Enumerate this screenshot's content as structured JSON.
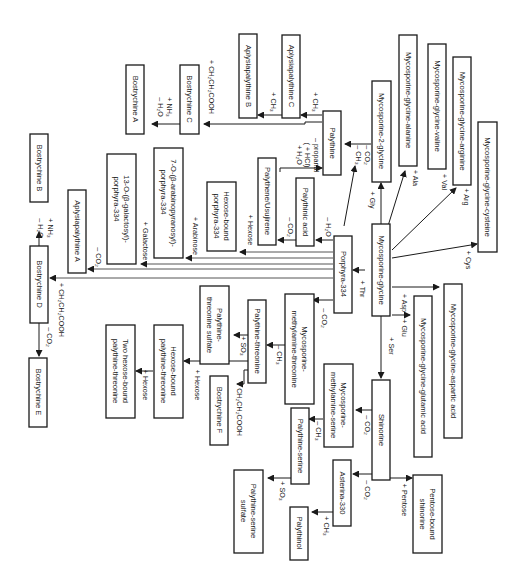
{
  "diagram": {
    "title": "",
    "orientation": "rotated-90-clockwise",
    "nodes": {
      "mg": "Mycosporine-glycine",
      "m2g": "Mycosporine-2-glycine",
      "mga": "Mycosporine-glycine-alanine",
      "mgv": "Mycosporine-glycine-valine",
      "mgr": "Mycosporine-glycine-arginine",
      "mgc": "Mycosporine-glycine-cysteine",
      "mgasp": "Mycosporine-glycine-aspartic acid",
      "mgglu": "Mycosporine-glycine-glutamic acid",
      "palythine": "Palythine",
      "aplyC": "Aplysiapalythine C",
      "aplyB": "Aplysiapalythine B",
      "bostC": "Bostrychine C",
      "bostA": "Bostrychine A",
      "palythene": "Palythene/Usujirene",
      "palythinic": "Palythinic acid",
      "p334": "Porphyra-334",
      "hexp334_1": "Hexose-bound",
      "hexp334_2": "porphyra-334",
      "arab_1": "7-O-(β-arabinopyranosyl)-",
      "arab_2": "porphyra-334",
      "gal_1": "13-O-(β-galactosyl)-",
      "gal_2": "porphyra-334",
      "aplyA": "Aplysiapalythine A",
      "bostB": "Bostrychine B",
      "bostD": "Bostrychine D",
      "bostE": "Bostrychine E",
      "mmt_1": "Mycosporine-",
      "mmt_2": "methylamine-threonine",
      "pthr": "Palythine-threonine",
      "pthrs_1": "Palythine-",
      "pthrs_2": "threonine sulfate",
      "bostF": "Bostrychine F",
      "hexpthr_1": "Hexose-bound",
      "hexpthr_2": "palythine-threonine",
      "twohex_1": "Two hexose-bound",
      "twohex_2": "palythine-threonine",
      "shinorine": "Shinorine",
      "mms_1": "Mycosporine-",
      "mms_2": "methylamine-serine",
      "pser": "Palythine-serine",
      "psers_1": "Palythine-serine",
      "psers_2": "sulfate",
      "ast": "Asterina-330",
      "palythinol": "Palythinol",
      "pent_1": "Pentose-bound",
      "pent_2": "shinorine"
    },
    "edge_labels": {
      "gly": "+ Gly",
      "ala": "+ Ala",
      "val": "+ Val",
      "arg": "+ Arg",
      "cys": "+ Cys",
      "asp": "+ Asp",
      "glu": "+ Glu",
      "ser": "+ Ser",
      "thr": "+ Thr",
      "m2g_co2": "– CO₂",
      "m2g_ch3": "– CH₃",
      "pal_ch3_a": "+ CH₃",
      "pal_ch3_b": "+ CH₃",
      "pal_ccooh": "+ CH₂CH₂COOH",
      "nh3_a": "+ NH₃",
      "h2o_a": "– H₂O",
      "propanal": "– propanal",
      "hcl": "( + HCl)",
      "h2o_add": "+ H₂O",
      "p334_h2o": "– H₂O",
      "palythinic_co2": "– CO₂",
      "hexose1": "+ Hexose",
      "arabinose": "+ Arabinose",
      "galactose": "+ Galactose",
      "p334_co2_a": "– CO₂",
      "nh3_b": "+ NH₃",
      "h2o_b": "– H₂O",
      "bostD_ccooh": "+ CH₂CH₂COOH",
      "bostD_co2": "– CO₂",
      "p334_co2_b": "– CO₂",
      "mmt_ch3": "– CH₃",
      "so3_a": "+ SO₃",
      "ccooh_f": "+ CH₂CH₂COOH",
      "hexose2": "+ Hexose",
      "hexose3": "+ Hexose",
      "shin_co2_a": "– CO₂",
      "mms_ch3": "– CH₃",
      "so3_b": "+ SO₃",
      "shin_co2_b": "– CO₂",
      "ast_ch3": "+ CH₃",
      "pentose": "+ Pentose"
    }
  }
}
